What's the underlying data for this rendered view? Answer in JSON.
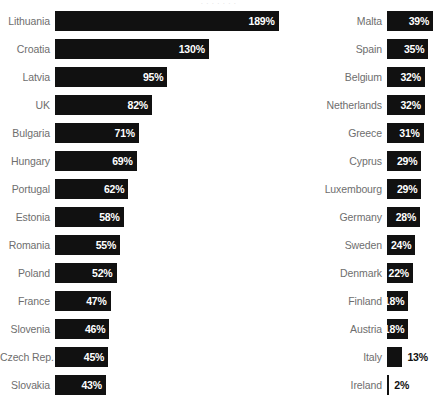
{
  "top_clipped_text": "·  ·   ·    ·      ·    ·   ·",
  "chart_data": {
    "type": "bar",
    "title": "",
    "subtitle": "",
    "xlabel": "",
    "ylabel": "",
    "orientation": "horizontal",
    "grid": false,
    "legend": "none",
    "value_suffix": "%",
    "xlim": [
      0,
      189
    ],
    "layout": "two-column; left column bars grow rightward, right column bars grow leftward",
    "categories": [
      "Lithuania",
      "Croatia",
      "Latvia",
      "UK",
      "Bulgaria",
      "Hungary",
      "Portugal",
      "Estonia",
      "Romania",
      "Poland",
      "France",
      "Slovenia",
      "Czech Rep.",
      "Slovakia",
      "Malta",
      "Spain",
      "Belgium",
      "Netherlands",
      "Greece",
      "Cyprus",
      "Luxembourg",
      "Germany",
      "Sweden",
      "Denmark",
      "Finland",
      "Austria",
      "Italy",
      "Ireland"
    ],
    "values": [
      189,
      130,
      95,
      82,
      71,
      69,
      62,
      58,
      55,
      52,
      47,
      46,
      45,
      43,
      39,
      35,
      32,
      32,
      31,
      29,
      29,
      28,
      24,
      22,
      18,
      18,
      13,
      2
    ],
    "colors": {
      "bar": "#111111",
      "label": "#6e6e6e",
      "value_inside": "#ffffff",
      "value_outside": "#111111",
      "background": "#ffffff"
    }
  },
  "columns": {
    "left": [
      {
        "label": "Lithuania",
        "value": 189,
        "value_text": "189%",
        "label_inside": true
      },
      {
        "label": "Croatia",
        "value": 130,
        "value_text": "130%",
        "label_inside": true
      },
      {
        "label": "Latvia",
        "value": 95,
        "value_text": "95%",
        "label_inside": true
      },
      {
        "label": "UK",
        "value": 82,
        "value_text": "82%",
        "label_inside": true
      },
      {
        "label": "Bulgaria",
        "value": 71,
        "value_text": "71%",
        "label_inside": true
      },
      {
        "label": "Hungary",
        "value": 69,
        "value_text": "69%",
        "label_inside": true
      },
      {
        "label": "Portugal",
        "value": 62,
        "value_text": "62%",
        "label_inside": true
      },
      {
        "label": "Estonia",
        "value": 58,
        "value_text": "58%",
        "label_inside": true
      },
      {
        "label": "Romania",
        "value": 55,
        "value_text": "55%",
        "label_inside": true
      },
      {
        "label": "Poland",
        "value": 52,
        "value_text": "52%",
        "label_inside": true
      },
      {
        "label": "France",
        "value": 47,
        "value_text": "47%",
        "label_inside": true
      },
      {
        "label": "Slovenia",
        "value": 46,
        "value_text": "46%",
        "label_inside": true
      },
      {
        "label": "Czech Rep.",
        "value": 45,
        "value_text": "45%",
        "label_inside": true
      },
      {
        "label": "Slovakia",
        "value": 43,
        "value_text": "43%",
        "label_inside": true
      }
    ],
    "right": [
      {
        "label": "Malta",
        "value": 39,
        "value_text": "39%",
        "label_inside": true
      },
      {
        "label": "Spain",
        "value": 35,
        "value_text": "35%",
        "label_inside": true
      },
      {
        "label": "Belgium",
        "value": 32,
        "value_text": "32%",
        "label_inside": true
      },
      {
        "label": "Netherlands",
        "value": 32,
        "value_text": "32%",
        "label_inside": true
      },
      {
        "label": "Greece",
        "value": 31,
        "value_text": "31%",
        "label_inside": true
      },
      {
        "label": "Cyprus",
        "value": 29,
        "value_text": "29%",
        "label_inside": true
      },
      {
        "label": "Luxembourg",
        "value": 29,
        "value_text": "29%",
        "label_inside": true
      },
      {
        "label": "Germany",
        "value": 28,
        "value_text": "28%",
        "label_inside": true
      },
      {
        "label": "Sweden",
        "value": 24,
        "value_text": "24%",
        "label_inside": true
      },
      {
        "label": "Denmark",
        "value": 22,
        "value_text": "22%",
        "label_inside": true
      },
      {
        "label": "Finland",
        "value": 18,
        "value_text": "18%",
        "label_inside": true
      },
      {
        "label": "Austria",
        "value": 18,
        "value_text": "18%",
        "label_inside": true
      },
      {
        "label": "Italy",
        "value": 13,
        "value_text": "13%",
        "label_inside": false
      },
      {
        "label": "Ireland",
        "value": 2,
        "value_text": "2%",
        "label_inside": false
      }
    ]
  },
  "scale": {
    "px_per_percent": 1.183
  }
}
